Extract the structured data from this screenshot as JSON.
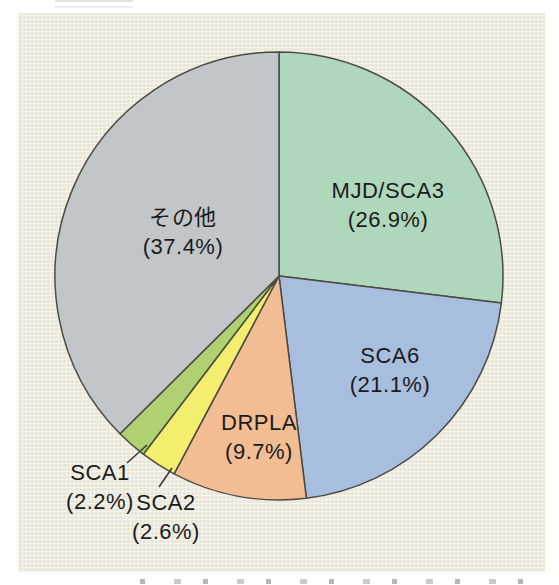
{
  "figure": {
    "panel_background_color": "#e9e6d4",
    "outer_background_color": "#ffffff",
    "slice_stroke_color": "#4b4a43",
    "text_color": "#1b1b1b"
  },
  "chart_data": {
    "type": "pie",
    "title": "",
    "direction": "clockwise",
    "start_angle_deg": 0,
    "labels_position": "inside slices; small slices labeled outside with leader lines",
    "slices": [
      {
        "label": "MJD/SCA3",
        "pct_label": "(26.9%)",
        "value": 26.9,
        "color": "#afd7bc"
      },
      {
        "label": "SCA6",
        "pct_label": "(21.1%)",
        "value": 21.1,
        "color": "#a8bedf"
      },
      {
        "label": "DRPLA",
        "pct_label": "(9.7%)",
        "value": 9.7,
        "color": "#f3bd94"
      },
      {
        "label": "SCA2",
        "pct_label": "(2.6%)",
        "value": 2.6,
        "color": "#f3ee6e"
      },
      {
        "label": "SCA1",
        "pct_label": "(2.2%)",
        "value": 2.2,
        "color": "#b0d171"
      },
      {
        "label": "その他",
        "pct_label": "(37.4%)",
        "value": 37.4,
        "color": "#c3c6c9"
      }
    ]
  }
}
